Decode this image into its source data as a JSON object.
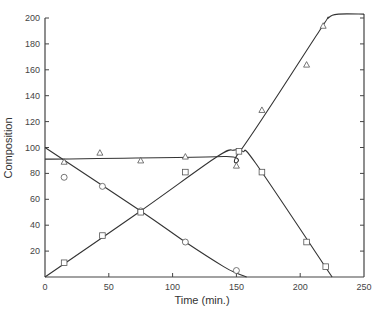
{
  "chart_data": {
    "type": "line",
    "title": "",
    "xlabel": "Time (min.)",
    "ylabel": "Composition",
    "xlim": [
      0,
      250
    ],
    "ylim": [
      0,
      200
    ],
    "xticks": [
      0,
      50,
      100,
      150,
      200,
      250
    ],
    "yticks": [
      20,
      40,
      60,
      80,
      100,
      120,
      140,
      160,
      180,
      200
    ],
    "grid": false,
    "legend": null,
    "series": [
      {
        "name": "triangles",
        "marker": "triangle",
        "points": [
          [
            15,
            89
          ],
          [
            43,
            96
          ],
          [
            75,
            90
          ],
          [
            110,
            93
          ],
          [
            150,
            86
          ],
          [
            170,
            129
          ],
          [
            205,
            164
          ],
          [
            218,
            194
          ]
        ],
        "curve": [
          [
            0,
            91
          ],
          [
            140,
            93
          ],
          [
            152,
            96
          ],
          [
            215,
            190
          ],
          [
            222,
            200
          ],
          [
            230,
            203
          ],
          [
            250,
            203
          ]
        ]
      },
      {
        "name": "circles",
        "marker": "circle",
        "points": [
          [
            15,
            77
          ],
          [
            45,
            70
          ],
          [
            75,
            51
          ],
          [
            110,
            27
          ],
          [
            150,
            5
          ]
        ],
        "curve": [
          [
            0,
            100
          ],
          [
            75,
            51
          ],
          [
            110,
            27
          ],
          [
            140,
            8
          ],
          [
            150,
            3
          ],
          [
            158,
            0
          ]
        ]
      },
      {
        "name": "squares",
        "marker": "square",
        "points": [
          [
            15,
            11
          ],
          [
            45,
            32
          ],
          [
            75,
            50
          ],
          [
            110,
            81
          ],
          [
            152,
            97
          ],
          [
            170,
            81
          ],
          [
            205,
            27
          ],
          [
            220,
            8
          ]
        ],
        "curve": [
          [
            0,
            0
          ],
          [
            75,
            51
          ],
          [
            135,
            93
          ],
          [
            148,
            98
          ],
          [
            155,
            97
          ],
          [
            165,
            88
          ],
          [
            225,
            0
          ]
        ]
      }
    ]
  }
}
